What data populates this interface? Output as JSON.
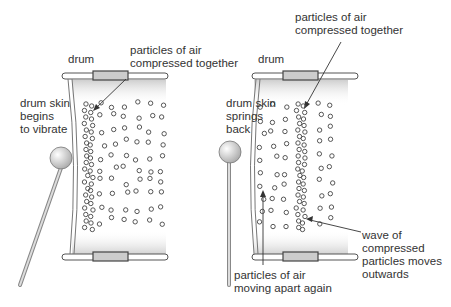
{
  "diagram": {
    "left_panel": {
      "drum_label": "drum",
      "skin_label": "drum skin\nbegins\nto vibrate",
      "compressed_label": "particles of air\ncompressed together"
    },
    "right_panel": {
      "drum_label": "drum",
      "skin_label": "drum skin\nsprings\nback",
      "compressed_label": "particles of air\ncompressed together",
      "apart_label": "particles of air\nmoving apart again",
      "wave_label": "wave of\ncompressed\nparticles moves\noutwards"
    },
    "colors": {
      "line": "#444444",
      "fill_top": "#cfcfcf",
      "fill_bottom": "#ffffff",
      "text": "#333333"
    }
  }
}
